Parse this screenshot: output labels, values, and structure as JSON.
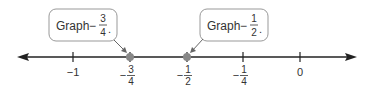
{
  "callouts": [
    {
      "text": "Graph",
      "sign": "−",
      "num": "3",
      "den": "4",
      "end": "."
    },
    {
      "text": "Graph",
      "sign": "−",
      "num": "1",
      "den": "2",
      "end": "."
    }
  ],
  "ticks": [
    {
      "label": "−1",
      "sign": "",
      "num": "",
      "den": ""
    },
    {
      "label": "",
      "sign": "−",
      "num": "3",
      "den": "4"
    },
    {
      "label": "",
      "sign": "−",
      "num": "1",
      "den": "2"
    },
    {
      "label": "",
      "sign": "−",
      "num": "1",
      "den": "4"
    },
    {
      "label": "0",
      "sign": "",
      "num": "",
      "den": ""
    }
  ],
  "points": [
    {
      "value": "-3/4",
      "color": "#888888"
    },
    {
      "value": "-1/2",
      "color": "#888888"
    }
  ]
}
